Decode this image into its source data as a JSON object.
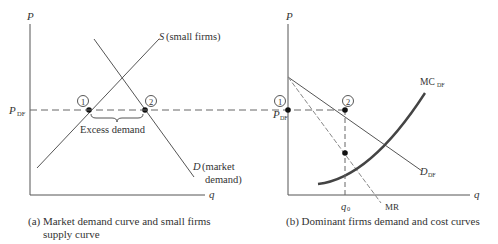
{
  "figure": {
    "panel_a": {
      "y_axis_label": "P",
      "x_axis_label": "q",
      "price_label": "P",
      "price_label_sub": "DF",
      "supply_label_letter": "S",
      "supply_label_text": "(small firms)",
      "demand_label_letter": "D",
      "demand_label_line1": "(market",
      "demand_label_line2": "demand)",
      "point1": "1",
      "point2": "2",
      "excess_label": "Excess demand",
      "caption_line1": "(a) Market demand curve and small firms",
      "caption_line2": "supply curve"
    },
    "panel_b": {
      "y_axis_label": "P",
      "x_axis_label": "q",
      "price_label": "P",
      "price_label_sub": "DF",
      "mc_label": "MC",
      "mc_label_sub": "DF",
      "demand_label": "D",
      "demand_label_sub": "DF",
      "mr_label": "MR",
      "q0_label": "q",
      "q0_sub": "0",
      "point1": "1",
      "point2": "2",
      "caption": "(b) Dominant firms demand and cost curves"
    }
  }
}
